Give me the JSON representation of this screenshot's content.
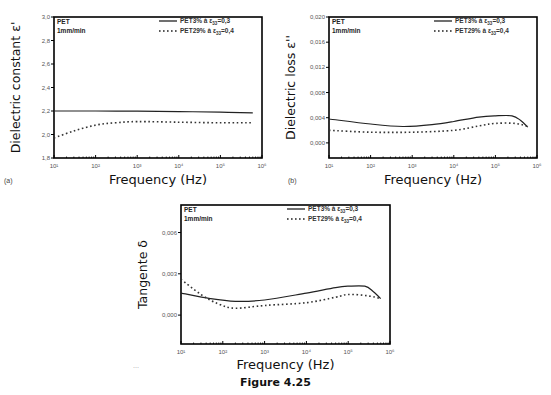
{
  "caption": "Figure 4.25",
  "chart_data": [
    {
      "id": "a",
      "type": "line",
      "panel_label": "(a)",
      "title": "",
      "annotation": [
        "PET",
        "1mm/min"
      ],
      "xlabel": "Frequency (Hz)",
      "ylabel": "Dielectric constant ε'",
      "xscale": "log",
      "xlim": [
        10,
        1000000
      ],
      "ylim": [
        1.8,
        3.0
      ],
      "xticks": [
        "10¹",
        "10²",
        "10³",
        "10⁴",
        "10⁵",
        "10⁶"
      ],
      "yticks": [
        "1,8",
        "2,0",
        "2,2",
        "2,4",
        "2,6",
        "2,8",
        "3,0"
      ],
      "ytick_values": [
        1.8,
        2.0,
        2.2,
        2.4,
        2.6,
        2.8,
        3.0
      ],
      "grid": false,
      "legend_position": "upper right",
      "series": [
        {
          "name": "PET3% à e33=0,3",
          "style": "solid",
          "x": [
            10,
            100,
            1000,
            10000,
            100000,
            600000
          ],
          "y": [
            2.2,
            2.2,
            2.198,
            2.195,
            2.19,
            2.185
          ]
        },
        {
          "name": "PET29% à e33=0,4",
          "style": "dotted",
          "x": [
            10,
            30,
            100,
            300,
            1000,
            10000,
            100000,
            600000
          ],
          "y": [
            1.97,
            2.03,
            2.08,
            2.1,
            2.11,
            2.105,
            2.1,
            2.1
          ]
        }
      ]
    },
    {
      "id": "b",
      "type": "line",
      "panel_label": "(b)",
      "title": "",
      "annotation": [
        "PET",
        "1mm/min"
      ],
      "xlabel": "Frequency (Hz)",
      "ylabel": "Dielectric loss ε''",
      "xscale": "log",
      "xlim": [
        10,
        1000000
      ],
      "ylim": [
        -0.0024,
        0.02
      ],
      "xticks": [
        "10¹",
        "10²",
        "10³",
        "10⁴",
        "10⁵",
        "10⁶"
      ],
      "yticks": [
        "0,000",
        "0,004",
        "0,008",
        "0,012",
        "0,016",
        "0,020"
      ],
      "ytick_values": [
        0.0,
        0.004,
        0.008,
        0.012,
        0.016,
        0.02
      ],
      "grid": false,
      "legend_position": "upper right",
      "series": [
        {
          "name": "PET3% à e33=0,3",
          "style": "solid",
          "x": [
            10,
            100,
            600,
            3000,
            10000,
            40000,
            100000,
            250000,
            400000,
            600000
          ],
          "y": [
            0.0038,
            0.003,
            0.0026,
            0.0029,
            0.0034,
            0.0041,
            0.0043,
            0.0043,
            0.0036,
            0.0025
          ]
        },
        {
          "name": "PET29% à e33=0,4",
          "style": "dotted",
          "x": [
            10,
            100,
            1000,
            10000,
            40000,
            100000,
            300000,
            600000
          ],
          "y": [
            0.002,
            0.0017,
            0.0017,
            0.002,
            0.0027,
            0.0031,
            0.0031,
            0.0026
          ]
        }
      ]
    },
    {
      "id": "c",
      "type": "line",
      "panel_label": "",
      "title": "",
      "annotation": [
        "PET",
        "1mm/min"
      ],
      "xlabel": "Frequency (Hz)",
      "ylabel": "Tangente δ",
      "xscale": "log",
      "xlim": [
        10,
        1000000
      ],
      "ylim": [
        -0.0021,
        0.008
      ],
      "xticks": [
        "10¹",
        "10²",
        "10³",
        "10⁴",
        "10⁵",
        "10⁶"
      ],
      "yticks": [
        "0,000",
        "0,003",
        "0,006"
      ],
      "ytick_values": [
        0.0,
        0.003,
        0.006
      ],
      "grid": false,
      "legend_position": "upper right",
      "series": [
        {
          "name": "PET3% à e33=0,3",
          "style": "solid",
          "x": [
            10,
            50,
            200,
            1000,
            10000,
            50000,
            100000,
            250000,
            400000,
            600000
          ],
          "y": [
            0.0016,
            0.0012,
            0.001,
            0.0011,
            0.0016,
            0.002,
            0.0021,
            0.0021,
            0.0017,
            0.0012
          ]
        },
        {
          "name": "PET29% à e33=0,4",
          "style": "dotted",
          "x": [
            10,
            30,
            80,
            200,
            1000,
            10000,
            50000,
            100000,
            300000,
            600000
          ],
          "y": [
            0.0026,
            0.0015,
            0.0008,
            0.0005,
            0.0007,
            0.0009,
            0.0013,
            0.0015,
            0.0014,
            0.0012
          ]
        }
      ]
    }
  ],
  "layout": {
    "plots": [
      {
        "left": 54,
        "top": 17,
        "right": 262,
        "bottom": 158,
        "ylab_x": 20,
        "xlab_y": 184,
        "panel_x": 4,
        "panel_y": 183
      },
      {
        "left": 329,
        "top": 17,
        "right": 537,
        "bottom": 158,
        "ylab_x": 295,
        "xlab_y": 184,
        "panel_x": 288,
        "panel_y": 183
      },
      {
        "left": 181,
        "top": 205,
        "right": 390,
        "bottom": 344,
        "ylab_x": 147,
        "xlab_y": 369,
        "panel_x": 0,
        "panel_y": 0
      }
    ]
  }
}
